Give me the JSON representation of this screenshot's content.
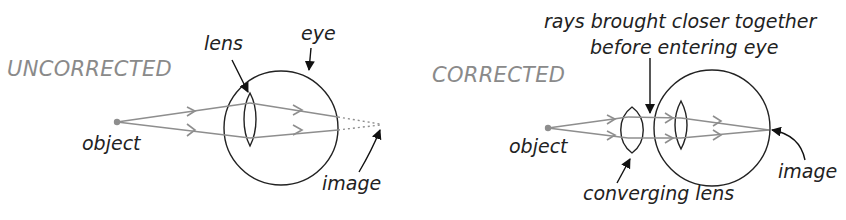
{
  "panels": {
    "uncorrected": {
      "title": "UNCORRECTED",
      "labels": {
        "object": "object",
        "lens": "lens",
        "eye": "eye",
        "image": "image"
      }
    },
    "corrected": {
      "title": "CORRECTED",
      "labels": {
        "object": "object",
        "annotation_line1": "rays brought closer together",
        "annotation_line2": "before entering eye",
        "converging_lens": "converging lens",
        "image": "image"
      }
    }
  },
  "colors": {
    "rays": "#8e8e8e",
    "outline": "#222222",
    "title": "#8a8a8a"
  }
}
